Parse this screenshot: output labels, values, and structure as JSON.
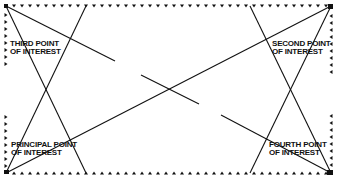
{
  "diagram": {
    "title": "",
    "frame": {
      "x1": 6,
      "y1": 6,
      "x2": 331,
      "y2": 173,
      "style": "arrow-dotted"
    },
    "colors": {
      "ink": "#111111",
      "background": "#ffffff"
    },
    "labels": {
      "third": {
        "line1": "THIRD POINT",
        "line2": "OF INTEREST"
      },
      "second": {
        "line1": "SECOND POINT",
        "line2": "OF INTEREST"
      },
      "principal": {
        "line1": "PRINCIPAL POINT",
        "line2": "OF INTEREST"
      },
      "fourth": {
        "line1": "FOURTH POINT",
        "line2": "OF INTEREST"
      }
    },
    "lines": [
      {
        "name": "diagonal-bl-tr",
        "from": [
          6,
          173
        ],
        "to": [
          331,
          6
        ],
        "style": "solid"
      },
      {
        "name": "diagonal-tl-br",
        "from": [
          6,
          6
        ],
        "to": [
          331,
          173
        ],
        "style": "broken"
      },
      {
        "name": "left-x-a",
        "from": [
          6,
          6
        ],
        "to": [
          86,
          173
        ],
        "style": "solid"
      },
      {
        "name": "left-x-b",
        "from": [
          86,
          6
        ],
        "to": [
          6,
          173
        ],
        "style": "solid"
      },
      {
        "name": "right-x-a",
        "from": [
          250,
          6
        ],
        "to": [
          331,
          173
        ],
        "style": "solid"
      },
      {
        "name": "right-x-b",
        "from": [
          331,
          6
        ],
        "to": [
          250,
          173
        ],
        "style": "solid"
      }
    ]
  }
}
